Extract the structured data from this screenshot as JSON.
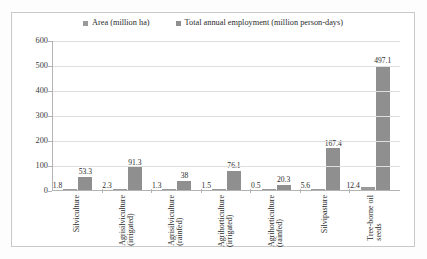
{
  "chart_data": {
    "type": "bar",
    "title": "",
    "xlabel": "",
    "ylabel": "",
    "ylim": [
      0,
      600
    ],
    "yticks": [
      0,
      100,
      200,
      300,
      400,
      500,
      600
    ],
    "grid": true,
    "legend_position": "top-center",
    "categories": [
      "Silviculture",
      "Agrisilviculture (irrigated)",
      "Agrisilviculture (rainfed)",
      "Agrihorticulture (irrigated)",
      "Agrihorticulture (rainfed)",
      "Silvipasture",
      "Tree-borne oil seeds"
    ],
    "category_lines": [
      [
        "Silviculture"
      ],
      [
        "Agrisilviculture",
        "(irrigated)"
      ],
      [
        "Agrisilviculture",
        "(rainfed)"
      ],
      [
        "Agrihorticulture",
        "(irrigated)"
      ],
      [
        "Agrihorticulture",
        "(rainfed)"
      ],
      [
        "Silvipasture"
      ],
      [
        "Tree-borne oil",
        "seeds"
      ]
    ],
    "series": [
      {
        "name": "Area (million ha)",
        "color": "#9a9a9a",
        "values": [
          1.8,
          2.3,
          1.3,
          1.5,
          0.5,
          5.6,
          12.4
        ],
        "labels": [
          "1.8",
          "2.3",
          "1.3",
          "1.5",
          "0.5",
          "5.6",
          "12.4"
        ]
      },
      {
        "name": "Total annual employment (million person-days)",
        "color": "#8f8f8f",
        "values": [
          53.3,
          91.3,
          38,
          76.1,
          20.3,
          167.4,
          497.1
        ],
        "labels": [
          "53.3",
          "91.3",
          "38",
          "76.1",
          "20.3",
          "167.4",
          "497.1"
        ]
      }
    ]
  },
  "legend": {
    "entries": [
      {
        "label": "Area (million ha)"
      },
      {
        "label": "Total annual employment (million person-days)"
      }
    ]
  },
  "axis": {
    "y_tick_labels": [
      "600",
      "500",
      "400",
      "300",
      "200",
      "100",
      "0"
    ]
  }
}
